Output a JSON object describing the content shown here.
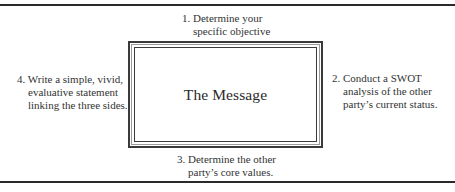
{
  "diagram": {
    "center": {
      "label": "The Message"
    },
    "steps": [
      {
        "number": "1.",
        "position": "top",
        "lines": [
          "1. Determine your",
          "specific objective"
        ]
      },
      {
        "number": "2.",
        "position": "right",
        "lines": [
          "2. Conduct a SWOT",
          "analysis of the other",
          "party’s current status."
        ]
      },
      {
        "number": "3.",
        "position": "bottom",
        "lines": [
          "3. Determine the other",
          "party’s core values."
        ]
      },
      {
        "number": "4.",
        "position": "left",
        "lines": [
          "4. Write a simple, vivid,",
          "evaluative statement",
          "linking the three sides."
        ]
      }
    ],
    "colors": {
      "text": "#2a2a2a",
      "frame": "#3a3a3a",
      "rule": "#2a2a2a",
      "background": "#ffffff"
    }
  }
}
